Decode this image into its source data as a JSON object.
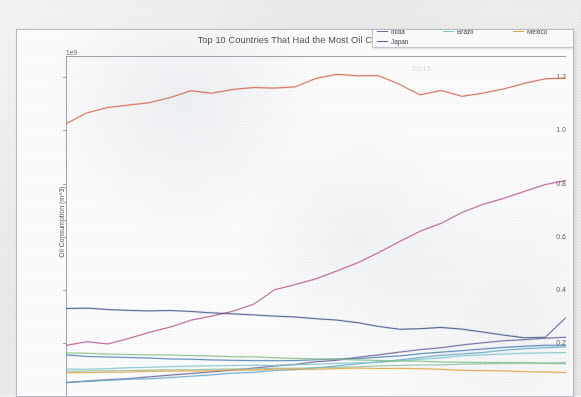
{
  "figure": {
    "title_visible_fragment": "Top 10 Countries That Had the Most Oil Consu",
    "ghost_text": "2015",
    "background": "#fdfdfd"
  },
  "axis": {
    "exponent_label": "1e9",
    "ylabel": "Oil Consumption (m^3)",
    "ytick_labels": [
      "1.2",
      "1.0",
      "0.8",
      "0.6",
      "0.4",
      "0.2"
    ],
    "xlabel": ""
  },
  "legend": {
    "columns": [
      {
        "entries": [
          {
            "label": "United States",
            "color": "#d2604a"
          },
          {
            "label": "China",
            "color": "#b5558f"
          },
          {
            "label": "India",
            "color": "#6a5f9e"
          },
          {
            "label": "Japan",
            "color": "#41558c"
          }
        ]
      },
      {
        "entries": [
          {
            "label": "Russia",
            "color": "#4a7fb5"
          },
          {
            "label": "Saudi Arabia",
            "color": "#5fa8cc"
          },
          {
            "label": "Brazil",
            "color": "#7fc6c8"
          }
        ]
      },
      {
        "entries": [
          {
            "label": "Canada",
            "color": "#8fc4a8"
          },
          {
            "label": "Germany",
            "color": "#86bf86"
          },
          {
            "label": "Mexico",
            "color": "#e0a33f"
          }
        ]
      }
    ]
  },
  "chart_data": {
    "type": "line",
    "xlabel": "",
    "ylabel": "Oil Consumption (m^3)",
    "y_exponent": "1e9",
    "ylim": [
      0.0,
      1.28
    ],
    "ytick_values": [
      0.2,
      0.4,
      0.6,
      0.8,
      1.0,
      1.2
    ],
    "grid": false,
    "legend_position": "upper right (floating, overlaps title)",
    "x_tick_labels_visible": false,
    "x_count": 25,
    "x": [
      1,
      2,
      3,
      4,
      5,
      6,
      7,
      8,
      9,
      10,
      11,
      12,
      13,
      14,
      15,
      16,
      17,
      18,
      19,
      20,
      21,
      22,
      23,
      24,
      25
    ],
    "series": [
      {
        "name": "United States",
        "color": "#d2604a",
        "values": [
          1.025,
          1.065,
          1.085,
          1.095,
          1.105,
          1.125,
          1.15,
          1.14,
          1.155,
          1.16,
          1.16,
          1.165,
          1.195,
          1.21,
          1.205,
          1.205,
          1.175,
          1.135,
          1.15,
          1.128,
          1.14,
          1.155,
          1.178,
          1.195,
          1.198
        ]
      },
      {
        "name": "China",
        "color": "#b5558f",
        "values": [
          0.19,
          0.205,
          0.195,
          0.215,
          0.24,
          0.26,
          0.285,
          0.3,
          0.32,
          0.345,
          0.4,
          0.42,
          0.44,
          0.47,
          0.5,
          0.54,
          0.58,
          0.62,
          0.65,
          0.69,
          0.72,
          0.745,
          0.77,
          0.795,
          0.812
        ]
      },
      {
        "name": "India",
        "color": "#6a5f9e",
        "values": [
          0.05,
          0.055,
          0.06,
          0.065,
          0.072,
          0.078,
          0.085,
          0.09,
          0.098,
          0.105,
          0.112,
          0.12,
          0.128,
          0.135,
          0.145,
          0.155,
          0.165,
          0.175,
          0.182,
          0.192,
          0.2,
          0.208,
          0.213,
          0.218,
          0.222
        ]
      },
      {
        "name": "Japan",
        "color": "#41558c",
        "values": [
          0.33,
          0.33,
          0.325,
          0.322,
          0.32,
          0.322,
          0.318,
          0.312,
          0.308,
          0.305,
          0.3,
          0.298,
          0.292,
          0.285,
          0.275,
          0.262,
          0.25,
          0.252,
          0.258,
          0.252,
          0.24,
          0.228,
          0.218,
          0.222,
          0.295
        ]
      },
      {
        "name": "Russia",
        "color": "#4a7fb5",
        "values": [
          0.155,
          0.15,
          0.148,
          0.145,
          0.142,
          0.14,
          0.138,
          0.136,
          0.135,
          0.134,
          0.133,
          0.134,
          0.136,
          0.138,
          0.14,
          0.145,
          0.15,
          0.158,
          0.165,
          0.17,
          0.176,
          0.182,
          0.186,
          0.19,
          0.192
        ]
      },
      {
        "name": "Saudi Arabia",
        "color": "#5fa8cc",
        "values": [
          0.052,
          0.055,
          0.058,
          0.062,
          0.066,
          0.07,
          0.075,
          0.08,
          0.085,
          0.09,
          0.095,
          0.1,
          0.106,
          0.112,
          0.12,
          0.128,
          0.136,
          0.145,
          0.152,
          0.158,
          0.165,
          0.172,
          0.178,
          0.182,
          0.185
        ]
      },
      {
        "name": "Brazil",
        "color": "#7fc6c8",
        "values": [
          0.1,
          0.102,
          0.104,
          0.106,
          0.108,
          0.11,
          0.112,
          0.113,
          0.114,
          0.115,
          0.116,
          0.118,
          0.12,
          0.122,
          0.125,
          0.128,
          0.132,
          0.138,
          0.144,
          0.15,
          0.154,
          0.158,
          0.16,
          0.162,
          0.163
        ]
      },
      {
        "name": "Canada",
        "color": "#8fc4a8",
        "values": [
          0.092,
          0.094,
          0.095,
          0.096,
          0.097,
          0.098,
          0.1,
          0.101,
          0.102,
          0.103,
          0.104,
          0.105,
          0.106,
          0.108,
          0.11,
          0.112,
          0.114,
          0.116,
          0.118,
          0.12,
          0.121,
          0.122,
          0.123,
          0.124,
          0.125
        ]
      },
      {
        "name": "Germany",
        "color": "#86bf86",
        "values": [
          0.162,
          0.16,
          0.158,
          0.156,
          0.155,
          0.154,
          0.152,
          0.15,
          0.148,
          0.146,
          0.144,
          0.142,
          0.14,
          0.138,
          0.136,
          0.134,
          0.132,
          0.13,
          0.128,
          0.127,
          0.126,
          0.125,
          0.124,
          0.123,
          0.122
        ]
      },
      {
        "name": "Mexico",
        "color": "#e0a33f",
        "values": [
          0.088,
          0.089,
          0.09,
          0.091,
          0.092,
          0.093,
          0.094,
          0.096,
          0.097,
          0.098,
          0.1,
          0.101,
          0.102,
          0.103,
          0.104,
          0.104,
          0.103,
          0.102,
          0.1,
          0.098,
          0.096,
          0.094,
          0.092,
          0.09,
          0.089
        ]
      }
    ]
  }
}
